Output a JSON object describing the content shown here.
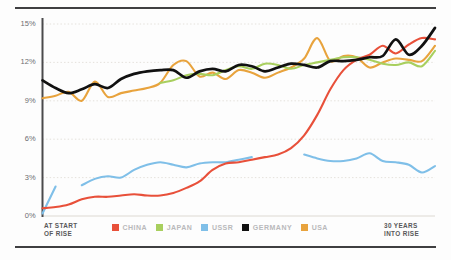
{
  "chart_data": {
    "type": "line",
    "title": "",
    "subtitle": "",
    "xlabel": "",
    "ylabel": "",
    "xlim": [
      0,
      30
    ],
    "ylim": [
      0,
      15
    ],
    "grid": true,
    "grid_style": "dotted-horizontal",
    "legend_position": "bottom-center",
    "y_ticks": [
      "0%",
      "3%",
      "6%",
      "9%",
      "12%",
      "15%"
    ],
    "y_tick_values": [
      0,
      3,
      6,
      9,
      12,
      15
    ],
    "x_axis_start_label": "AT START\nOF RISE",
    "x_axis_end_label": "30 YEARS\nINTO RISE",
    "x": [
      0,
      1,
      2,
      3,
      4,
      5,
      6,
      7,
      8,
      9,
      10,
      11,
      12,
      13,
      14,
      15,
      16,
      17,
      18,
      19,
      20,
      21,
      22,
      23,
      24,
      25,
      26,
      27,
      28,
      29,
      30
    ],
    "series": [
      {
        "name": "CHINA",
        "color": "#E8503A",
        "values": [
          0.6,
          0.7,
          0.9,
          1.3,
          1.5,
          1.5,
          1.6,
          1.7,
          1.6,
          1.6,
          1.8,
          2.2,
          2.7,
          3.6,
          4.1,
          4.2,
          4.4,
          4.6,
          4.8,
          5.3,
          6.3,
          7.9,
          9.9,
          11.4,
          12.2,
          12.6,
          13.3,
          12.7,
          13.4,
          13.9,
          13.8
        ]
      },
      {
        "name": "JAPAN",
        "color": "#A8CF5E",
        "values": [
          null,
          null,
          null,
          null,
          null,
          null,
          null,
          null,
          null,
          10.4,
          10.6,
          11.0,
          11.1,
          11.0,
          11.4,
          11.7,
          11.5,
          11.9,
          11.8,
          11.5,
          11.8,
          12.0,
          12.2,
          12.4,
          12.4,
          12.2,
          11.9,
          11.8,
          12.0,
          11.7,
          12.9
        ]
      },
      {
        "name": "USSR",
        "color": "#7FBFE8",
        "values": [
          0.2,
          2.3,
          null,
          2.4,
          2.9,
          3.1,
          3.0,
          3.6,
          4.0,
          4.2,
          4.0,
          3.8,
          4.1,
          4.2,
          4.2,
          4.4,
          4.6,
          null,
          null,
          null,
          4.8,
          4.5,
          4.3,
          4.3,
          4.5,
          4.9,
          4.3,
          4.2,
          4.0,
          3.4,
          3.9
        ]
      },
      {
        "name": "GERMANY",
        "color": "#111111",
        "values": [
          10.6,
          10.0,
          9.6,
          9.9,
          10.3,
          10.0,
          10.7,
          11.1,
          11.3,
          11.4,
          11.4,
          10.8,
          11.3,
          11.5,
          11.3,
          11.8,
          11.7,
          11.3,
          11.6,
          11.9,
          11.8,
          11.6,
          12.1,
          12.1,
          12.2,
          12.4,
          12.5,
          13.8,
          12.6,
          13.3,
          14.7
        ]
      },
      {
        "name": "USA",
        "color": "#E8A33D",
        "values": [
          9.2,
          9.4,
          9.7,
          9.0,
          10.5,
          9.3,
          9.6,
          9.8,
          10.0,
          10.4,
          11.8,
          12.1,
          10.9,
          11.2,
          10.7,
          11.4,
          11.2,
          10.8,
          11.2,
          11.6,
          12.3,
          13.9,
          12.1,
          12.5,
          12.4,
          11.6,
          12.0,
          12.3,
          12.2,
          12.1,
          13.3
        ]
      }
    ]
  },
  "axis": {
    "y_labels": [
      {
        "text": "15%",
        "value": 15
      },
      {
        "text": "12%",
        "value": 12
      },
      {
        "text": "9%",
        "value": 9
      },
      {
        "text": "6%",
        "value": 6
      },
      {
        "text": "3%",
        "value": 3
      },
      {
        "text": "0%",
        "value": 0
      }
    ],
    "left_caption_line1": "AT START",
    "left_caption_line2": "OF RISE",
    "right_caption_line1": "30 YEARS",
    "right_caption_line2": "INTO RISE"
  },
  "legend": {
    "items": [
      {
        "label": "CHINA",
        "color": "#E8503A"
      },
      {
        "label": "JAPAN",
        "color": "#A8CF5E"
      },
      {
        "label": "USSR",
        "color": "#7FBFE8"
      },
      {
        "label": "GERMANY",
        "color": "#111111"
      },
      {
        "label": "USA",
        "color": "#E8A33D"
      }
    ]
  },
  "style": {
    "rule_color": "#3f3f41",
    "axis_color": "#4a4a4c",
    "grid_color": "#ddd9d2",
    "background": "#fdfdfd"
  }
}
